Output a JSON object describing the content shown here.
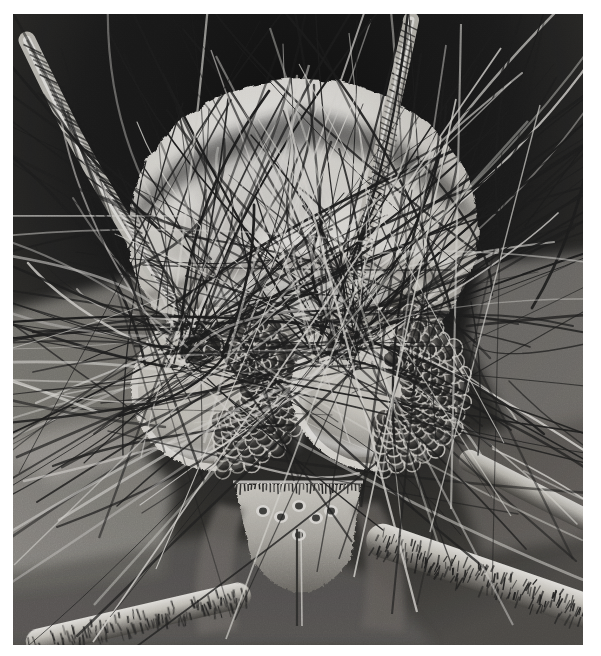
{
  "plate": {
    "kind": "scanning-electron-micrograph",
    "subject": "insect head, frontal view",
    "palette": {
      "paper": "#ffffff",
      "background_dark": "#191919",
      "background_mid": "#2e2e2e",
      "cuticle_bright": "#f2f0ec",
      "cuticle_mid": "#b9b6b0",
      "cuticle_shadow": "#6a6762",
      "seta_dark": "#1c1c1c",
      "seta_light": "#e8e6e1",
      "facet_dark": "#2a2a2a",
      "facet_rim": "#dedbd5"
    },
    "margin_px": {
      "left": 13,
      "top": 14,
      "right": 18,
      "bottom": 11
    },
    "photo_size_px": {
      "width": 570,
      "height": 631
    }
  },
  "anatomy": {
    "head_capsule": {
      "name": "head capsule (vertex / frons)",
      "tone": "bright",
      "center": {
        "x": 290,
        "y": 215
      },
      "radius": {
        "x": 175,
        "y": 150
      }
    },
    "compound_eyes": [
      {
        "side": "left",
        "name": "left compound eye",
        "center": {
          "x": 205,
          "y": 375
        },
        "radius": {
          "x": 85,
          "y": 80
        },
        "facet_rows": 11,
        "facet_cols": 9,
        "facet_diameter_px": 15
      },
      {
        "side": "right",
        "name": "right compound eye",
        "center": {
          "x": 365,
          "y": 375
        },
        "radius": {
          "x": 85,
          "y": 80
        },
        "facet_rows": 11,
        "facet_cols": 9,
        "facet_diameter_px": 15
      }
    ],
    "antennae": [
      {
        "side": "left",
        "name": "left antenna scape and flagellum",
        "base": {
          "x": 185,
          "y": 325
        },
        "tip": {
          "x": 15,
          "y": 30
        }
      },
      {
        "side": "right",
        "name": "right antenna scape and flagellum",
        "base": {
          "x": 330,
          "y": 320
        },
        "tip": {
          "x": 400,
          "y": 8
        }
      }
    ],
    "mouthparts": {
      "name": "clypeus, labrum and maxillary palps",
      "center": {
        "x": 280,
        "y": 545
      },
      "sensory_pits": 6
    },
    "legs": [
      {
        "name": "foreleg tibia with spine rows",
        "from": {
          "x": 390,
          "y": 520
        },
        "to": {
          "x": 580,
          "y": 600
        }
      },
      {
        "name": "foreleg tarsus",
        "from": {
          "x": 60,
          "y": 640
        },
        "to": {
          "x": 320,
          "y": 560
        }
      }
    ],
    "setae": {
      "name": "setae (bristles / hairs)",
      "count": 300,
      "note": "dense crossing bristles over head capsule and antennae"
    }
  }
}
